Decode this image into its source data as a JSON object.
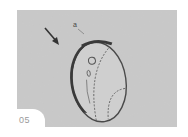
{
  "illustration": {
    "step_number": "05",
    "callout_label": "a",
    "colors": {
      "background": "#c9c9c9",
      "outline": "#4a4a4a",
      "ring": "#3a3a3a",
      "page": "#ffffff",
      "step_text": "#9a9a9a"
    }
  }
}
